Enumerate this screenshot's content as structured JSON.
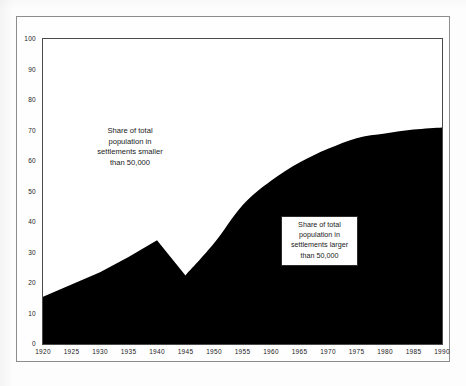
{
  "chart_data": {
    "type": "area",
    "title": "",
    "subtitle": "",
    "xlabel": "",
    "ylabel": "",
    "xlim": [
      1920,
      1990
    ],
    "ylim": [
      0,
      100
    ],
    "grid": false,
    "legend_position": "inside-annotations",
    "x_tick_labels": [
      "1920",
      "1925",
      "1930",
      "1935",
      "1940",
      "1945",
      "1950",
      "1955",
      "1960",
      "1965",
      "1970",
      "1975",
      "1980",
      "1985",
      "1990"
    ],
    "y_tick_labels": [
      "0",
      "10",
      "20",
      "30",
      "40",
      "50",
      "60",
      "70",
      "80",
      "90",
      "100"
    ],
    "x": [
      1920,
      1925,
      1930,
      1935,
      1940,
      1945,
      1950,
      1955,
      1960,
      1965,
      1970,
      1975,
      1980,
      1985,
      1990
    ],
    "series": [
      {
        "name": "Share of total population in settlements larger than 50,000",
        "fill_color": "#000000",
        "values": [
          15.5,
          19.5,
          23.5,
          28.5,
          34.0,
          22.5,
          33.0,
          45.5,
          53.5,
          59.5,
          64.0,
          67.5,
          69.0,
          70.3,
          71.0
        ]
      },
      {
        "name": "Share of total population in settlements smaller than 50,000",
        "fill_color": "#ffffff",
        "values": [
          84.5,
          80.5,
          76.5,
          71.5,
          66.0,
          77.5,
          67.0,
          54.5,
          46.5,
          40.5,
          36.0,
          32.5,
          31.0,
          29.7,
          29.0
        ]
      }
    ],
    "annotations": [
      {
        "id": "smaller",
        "boxed": false,
        "lines": [
          "Share of total",
          "population in",
          "settlements smaller",
          "than 50,000"
        ]
      },
      {
        "id": "larger",
        "boxed": true,
        "lines": [
          "Share of total",
          "population in",
          "settlements larger",
          "than 50,000"
        ]
      }
    ]
  },
  "colors": {
    "area_fill": "#000000",
    "background": "#ffffff",
    "axis": "#4a4a4a",
    "text": "#1a1a1a"
  }
}
